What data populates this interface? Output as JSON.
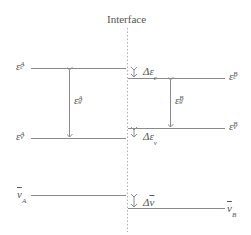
{
  "title": "Interface",
  "colors": {
    "lines": "#8a8a8a",
    "text": "#555555",
    "background": "#ffffff"
  },
  "levels": {
    "material_A": {
      "conduction_band": {
        "symbol": "ε",
        "sub": "c",
        "sup": "A"
      },
      "valence_band": {
        "symbol": "ε",
        "sub": "v",
        "sup": "A"
      },
      "bandgap": {
        "symbol": "ε",
        "sub": "g",
        "sup": "A"
      },
      "mean_level": {
        "symbol": "v",
        "sub": "A",
        "overline": true
      }
    },
    "material_B": {
      "conduction_band": {
        "symbol": "ε",
        "sub": "c",
        "sup": "B"
      },
      "valence_band": {
        "symbol": "ε",
        "sub": "v",
        "sup": "B"
      },
      "bandgap": {
        "symbol": "ε",
        "sub": "g",
        "sup": "B"
      },
      "mean_level": {
        "symbol": "v",
        "sub": "B",
        "overline": true
      }
    }
  },
  "offsets": {
    "conduction": {
      "prefix": "Δε",
      "sub": "c"
    },
    "valence": {
      "prefix": "Δε",
      "sub": "v"
    },
    "mean": {
      "prefix": "Δ",
      "symbol": "v",
      "overline": true
    }
  },
  "labels": {
    "eps": "ε",
    "delta_eps": "Δε",
    "delta": "Δ",
    "v": "v",
    "c": "c",
    "g": "g",
    "vsub": "v",
    "A": "A",
    "B": "B"
  }
}
